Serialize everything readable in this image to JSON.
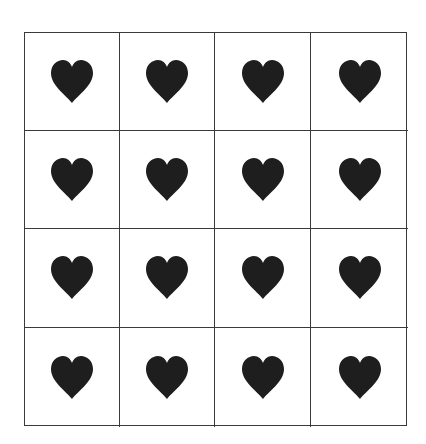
{
  "figure": {
    "type": "grid-of-icons",
    "rows": 4,
    "columns": 4,
    "total_items": 16,
    "icon": "heart-icon",
    "icon_color": "#1e1e1e",
    "line_color": "#3a3a3a",
    "background": "#ffffff"
  }
}
